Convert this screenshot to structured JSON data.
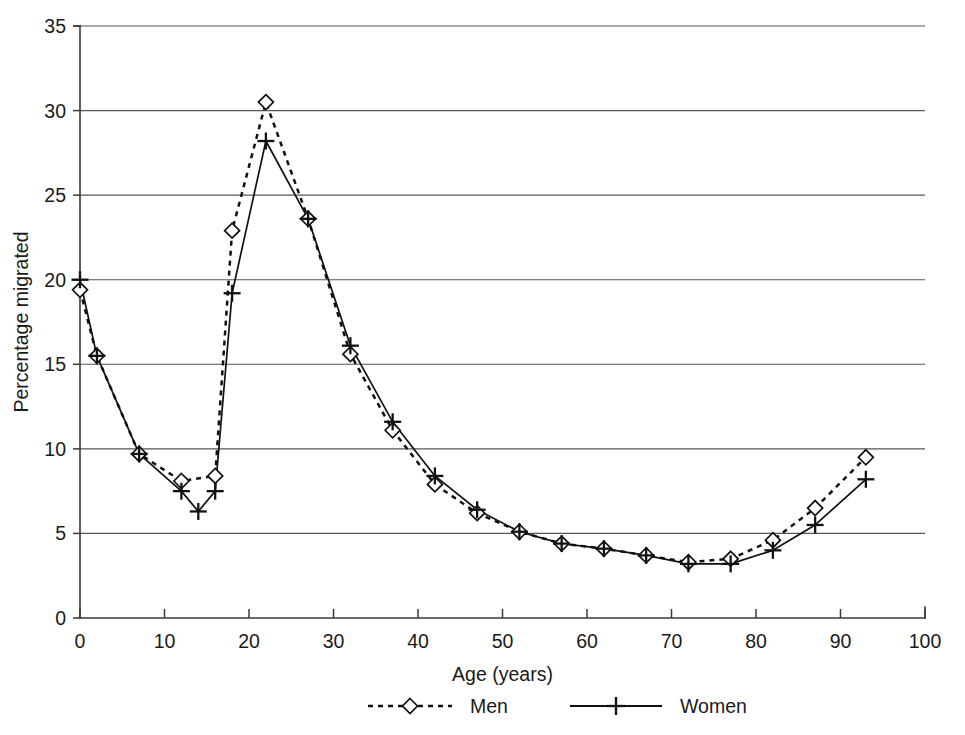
{
  "chart_data": {
    "type": "line",
    "title": "",
    "xlabel": "Age (years)",
    "ylabel": "Percentage migrated",
    "xlim": [
      0,
      100
    ],
    "ylim": [
      0,
      35
    ],
    "xticks": [
      0,
      10,
      20,
      30,
      40,
      50,
      60,
      70,
      80,
      90,
      100
    ],
    "yticks": [
      0,
      5,
      10,
      15,
      20,
      25,
      30,
      35
    ],
    "grid": "horizontal",
    "legend_position": "bottom",
    "series": [
      {
        "name": "Men",
        "marker": "diamond",
        "linestyle": "dashed",
        "color": "#111111",
        "x": [
          0,
          2,
          7,
          12,
          16,
          18,
          22,
          27,
          32,
          37,
          42,
          47,
          52,
          57,
          62,
          67,
          72,
          77,
          82,
          87,
          93
        ],
        "values": [
          19.4,
          15.5,
          9.7,
          8.1,
          8.4,
          22.9,
          30.5,
          23.6,
          15.6,
          11.1,
          7.9,
          6.2,
          5.1,
          4.4,
          4.1,
          3.7,
          3.3,
          3.5,
          4.6,
          6.5,
          9.5
        ]
      },
      {
        "name": "Women",
        "marker": "plus",
        "linestyle": "solid",
        "color": "#111111",
        "x": [
          0,
          2,
          7,
          12,
          14,
          16,
          18,
          22,
          27,
          32,
          37,
          42,
          47,
          52,
          57,
          62,
          67,
          72,
          77,
          82,
          87,
          93
        ],
        "values": [
          20.0,
          15.5,
          9.7,
          7.5,
          6.3,
          7.5,
          19.2,
          28.2,
          23.6,
          16.1,
          11.6,
          8.4,
          6.4,
          5.1,
          4.4,
          4.1,
          3.7,
          3.2,
          3.2,
          4.0,
          5.5,
          8.2
        ]
      }
    ]
  },
  "legend": {
    "items": [
      {
        "label": "Men"
      },
      {
        "label": "Women"
      }
    ]
  }
}
